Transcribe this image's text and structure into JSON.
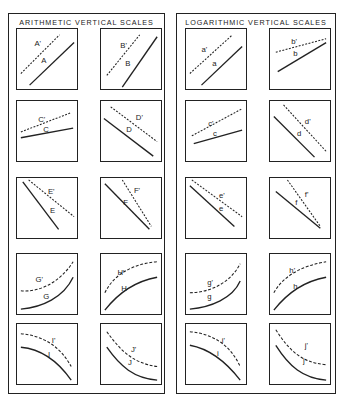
{
  "panels": [
    {
      "title": "ARITHMETIC VERTICAL SCALES",
      "cells": [
        {
          "solid": "A",
          "dashed": "A'",
          "shape": "parallel-rising"
        },
        {
          "solid": "B",
          "dashed": "B'",
          "shape": "parallel-steep-rising"
        },
        {
          "solid": "C",
          "dashed": "C'",
          "shape": "diverging-shallow-rising"
        },
        {
          "solid": "D",
          "dashed": "D'",
          "shape": "parallel-falling"
        },
        {
          "solid": "E",
          "dashed": "E'",
          "shape": "diverging-falling"
        },
        {
          "solid": "F",
          "dashed": "F'",
          "shape": "converging-falling"
        },
        {
          "solid": "G",
          "dashed": "G'",
          "shape": "concave-up-rising"
        },
        {
          "solid": "H",
          "dashed": "H'",
          "shape": "concave-down-rising"
        },
        {
          "solid": "I",
          "dashed": "I'",
          "shape": "concave-down-falling"
        },
        {
          "solid": "J",
          "dashed": "J'",
          "shape": "concave-up-falling"
        }
      ]
    },
    {
      "title": "LOGARITHMIC VERTICAL SCALES",
      "cells": [
        {
          "solid": "a",
          "dashed": "a'",
          "shape": "parallel-rising"
        },
        {
          "solid": "b",
          "dashed": "b'",
          "shape": "converging-rising"
        },
        {
          "solid": "c",
          "dashed": "c'",
          "shape": "parallel-shallow-rising"
        },
        {
          "solid": "d",
          "dashed": "d'",
          "shape": "parallel-falling"
        },
        {
          "solid": "e",
          "dashed": "e'",
          "shape": "diverging-falling"
        },
        {
          "solid": "f",
          "dashed": "f'",
          "shape": "converging-falling"
        },
        {
          "solid": "g",
          "dashed": "g'",
          "shape": "concave-up-rising"
        },
        {
          "solid": "h",
          "dashed": "h'",
          "shape": "concave-down-rising"
        },
        {
          "solid": "i",
          "dashed": "i'",
          "shape": "concave-down-falling"
        },
        {
          "solid": "j",
          "dashed": "j'",
          "shape": "concave-up-falling"
        }
      ]
    }
  ]
}
